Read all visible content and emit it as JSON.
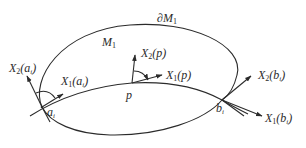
{
  "diagram": {
    "type": "differential-geometry-figure",
    "stroke_color": "#2b2b2b",
    "background": "#ffffff",
    "region_label": {
      "main": "M",
      "sub": "1"
    },
    "boundary_label": {
      "prefix": "∂M",
      "sub": "1"
    },
    "points": {
      "a": {
        "name": "a",
        "sub": "i"
      },
      "p": {
        "name": "p"
      },
      "b": {
        "name": "b",
        "sub": "i"
      }
    },
    "vectors": {
      "x2_a": {
        "name": "X",
        "sub": "2",
        "arg": "a",
        "argsub": "i"
      },
      "x1_a": {
        "name": "X",
        "sub": "1",
        "arg": "a",
        "argsub": "i"
      },
      "x2_p": {
        "name": "X",
        "sub": "2",
        "arg": "p"
      },
      "x1_p": {
        "name": "X",
        "sub": "1",
        "arg": "p"
      },
      "x2_b": {
        "name": "X",
        "sub": "2",
        "arg": "b",
        "argsub": "i"
      },
      "x1_b": {
        "name": "X",
        "sub": "1",
        "arg": "b",
        "argsub": "i"
      }
    },
    "paren_open": "(",
    "paren_close": ")"
  }
}
